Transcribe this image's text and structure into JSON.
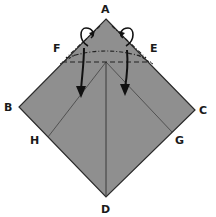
{
  "diagram": {
    "type": "origami-fold-step",
    "colors": {
      "paper_fill": "#8f8f8f",
      "edge": "#2a2a2a",
      "crease": "#3a3a3a",
      "arrow": "#111111",
      "background": "#ffffff"
    },
    "points": {
      "A": {
        "label": "A",
        "x": 106,
        "y": 19,
        "label_x": 101,
        "label_y": 13
      },
      "B": {
        "label": "B",
        "x": 19,
        "y": 107,
        "label_x": 4,
        "label_y": 111
      },
      "C": {
        "label": "C",
        "x": 195,
        "y": 110,
        "label_x": 199,
        "label_y": 114
      },
      "D": {
        "label": "D",
        "x": 106,
        "y": 197,
        "label_x": 101,
        "label_y": 213
      },
      "E": {
        "label": "E",
        "x": 151,
        "y": 61,
        "label_x": 150,
        "label_y": 52
      },
      "F": {
        "label": "F",
        "x": 62,
        "y": 61,
        "label_x": 53,
        "label_y": 52
      },
      "G": {
        "label": "G",
        "x": 172,
        "y": 132,
        "label_x": 175,
        "label_y": 144
      },
      "H": {
        "label": "H",
        "x": 48,
        "y": 137,
        "label_x": 30,
        "label_y": 144
      }
    },
    "labels": [
      "A",
      "B",
      "C",
      "D",
      "E",
      "F",
      "G",
      "H"
    ],
    "annotations": {
      "valley_fold_line": "dashed horizontal line through F and E",
      "mountain_fold_lines": "dash-dot lines from A toward F and E",
      "arrows": "two downward arrows pulling flaps down; two loop arrows near A indicating fold behind"
    }
  }
}
